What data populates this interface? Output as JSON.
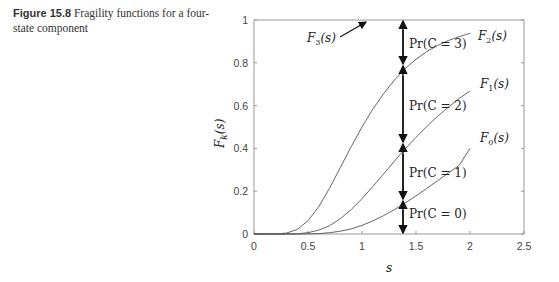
{
  "caption": {
    "figure_label": "Figure 15.8",
    "text": "Fragility functions for a four-state component"
  },
  "chart_data": {
    "type": "line",
    "title": "",
    "xlabel": "s",
    "ylabel": "F_k(s)",
    "xlim": [
      0,
      2.5
    ],
    "ylim": [
      0,
      1
    ],
    "xticks": [
      0,
      0.5,
      1,
      1.5,
      2,
      2.5
    ],
    "xtick_labels": [
      "0",
      "0.5",
      "1",
      "1.5",
      "2",
      "2.5"
    ],
    "yticks": [
      0,
      0.2,
      0.4,
      0.6,
      0.8,
      1
    ],
    "ytick_labels": [
      "0",
      "0.2",
      "0.4",
      "0.6",
      "0.8",
      "1"
    ],
    "grid": false,
    "x": [
      0,
      0.1,
      0.2,
      0.3,
      0.4,
      0.5,
      0.6,
      0.7,
      0.8,
      0.9,
      1.0,
      1.1,
      1.2,
      1.3,
      1.4,
      1.5,
      1.6,
      1.7,
      1.8,
      1.9,
      2.0
    ],
    "series": [
      {
        "name": "F_3(s)",
        "values": [
          1,
          1,
          1,
          1,
          1,
          1,
          1,
          1,
          1,
          1,
          1,
          1,
          1,
          1,
          1,
          1,
          1,
          1,
          1,
          1,
          1
        ]
      },
      {
        "name": "F_2(s)",
        "values": [
          0,
          0.0,
          0.0002,
          0.004,
          0.021,
          0.062,
          0.128,
          0.214,
          0.311,
          0.408,
          0.5,
          0.583,
          0.655,
          0.719,
          0.773,
          0.817,
          0.853,
          0.881,
          0.904,
          0.922,
          0.938
        ]
      },
      {
        "name": "F_1(s)",
        "values": [
          0,
          0.0,
          0.0,
          0.0001,
          0.001,
          0.006,
          0.018,
          0.039,
          0.072,
          0.114,
          0.165,
          0.222,
          0.281,
          0.34,
          0.398,
          0.452,
          0.503,
          0.55,
          0.593,
          0.633,
          0.668
        ]
      },
      {
        "name": "F_0(s)",
        "values": [
          0,
          0.0,
          0.0,
          0.0,
          0.0,
          0.0005,
          0.002,
          0.006,
          0.013,
          0.024,
          0.04,
          0.061,
          0.086,
          0.114,
          0.145,
          0.178,
          0.213,
          0.249,
          0.285,
          0.321,
          0.4
        ]
      }
    ],
    "annotations": [
      {
        "text": "F_3(s)",
        "arrow_to": [
          1.05,
          1.0
        ]
      },
      {
        "text": "F_2(s)"
      },
      {
        "text": "F_1(s)"
      },
      {
        "text": "F_0(s)"
      },
      {
        "text": "Pr(C = 3)"
      },
      {
        "text": "Pr(C = 2)"
      },
      {
        "text": "Pr(C = 1)"
      },
      {
        "text": "Pr(C = 0)"
      }
    ],
    "marker_line_s": 1.38,
    "marker_intersections": [
      0,
      0.16,
      0.425,
      0.79,
      1.0
    ]
  },
  "labels": {
    "x_axis": "s",
    "y_axis_main": "F",
    "y_axis_sub": "k",
    "y_axis_arg": "(s)",
    "f3": "F",
    "f3_sub": "3",
    "f3_arg": "(s)",
    "f2": "F",
    "f2_sub": "2",
    "f2_arg": "(s)",
    "f1": "F",
    "f1_sub": "1",
    "f1_arg": "(s)",
    "f0": "F",
    "f0_sub": "0",
    "f0_arg": "(s)",
    "pr3": "Pr(C = 3)",
    "pr2": "Pr(C = 2)",
    "pr1": "Pr(C = 1)",
    "pr0": "Pr(C = 0)"
  }
}
